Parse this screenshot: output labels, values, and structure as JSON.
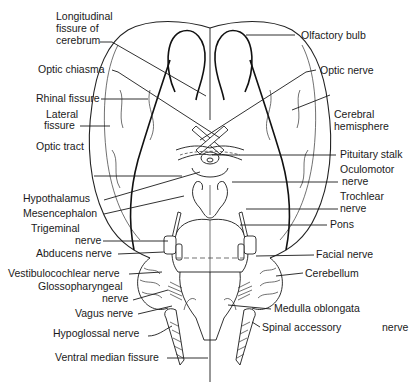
{
  "figure": {
    "colors": {
      "ink": "#1a1a1a",
      "background": "#ffffff"
    }
  },
  "labels": {
    "left": [
      {
        "id": "longitudinal_fissure",
        "lines": [
          "Longitudinal",
          "fissure of",
          "cerebrum"
        ]
      },
      {
        "id": "optic_chiasma",
        "lines": [
          "Optic chiasma"
        ]
      },
      {
        "id": "rhinal_fissure",
        "lines": [
          "Rhinal fissure"
        ]
      },
      {
        "id": "lateral_fissure",
        "lines": [
          "Lateral",
          "fissure"
        ]
      },
      {
        "id": "optic_tract",
        "lines": [
          "Optic tract"
        ]
      },
      {
        "id": "hypothalamus",
        "lines": [
          "Hypothalamus"
        ]
      },
      {
        "id": "mesencephalon",
        "lines": [
          "Mesencephalon"
        ]
      },
      {
        "id": "trigeminal_nerve",
        "lines": [
          "Trigeminal",
          "nerve"
        ]
      },
      {
        "id": "abducens_nerve",
        "lines": [
          "Abducens nerve"
        ]
      },
      {
        "id": "vestibulocochlear_nerve",
        "lines": [
          "Vestibulocochlear nerve"
        ]
      },
      {
        "id": "glossopharyngeal_nerve",
        "lines": [
          "Glossopharyngeal",
          "nerve"
        ]
      },
      {
        "id": "vagus_nerve",
        "lines": [
          "Vagus nerve"
        ]
      },
      {
        "id": "hypoglossal_nerve",
        "lines": [
          "Hypoglossal nerve"
        ]
      },
      {
        "id": "ventral_median_fissure",
        "lines": [
          "Ventral median fissure"
        ]
      }
    ],
    "right": [
      {
        "id": "olfactory_bulb",
        "lines": [
          "Olfactory bulb"
        ]
      },
      {
        "id": "optic_nerve",
        "lines": [
          "Optic nerve"
        ]
      },
      {
        "id": "cerebral_hemisphere",
        "lines": [
          "Cerebral",
          "hemisphere"
        ]
      },
      {
        "id": "pituitary_stalk",
        "lines": [
          "Pituitary stalk"
        ]
      },
      {
        "id": "oculomotor_nerve",
        "lines": [
          "Oculomotor",
          "nerve"
        ]
      },
      {
        "id": "trochlear_nerve",
        "lines": [
          "Trochlear",
          "nerve"
        ]
      },
      {
        "id": "pons",
        "lines": [
          "Pons"
        ]
      },
      {
        "id": "facial_nerve",
        "lines": [
          "Facial nerve"
        ]
      },
      {
        "id": "cerebellum",
        "lines": [
          "Cerebellum"
        ]
      },
      {
        "id": "medulla_oblongata",
        "lines": [
          "Medulla oblongata"
        ]
      },
      {
        "id": "spinal_accessory_nerve",
        "lines": [
          "Spinal accessory",
          "nerve"
        ]
      }
    ]
  }
}
